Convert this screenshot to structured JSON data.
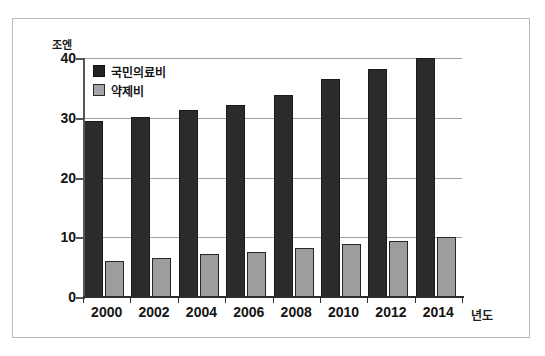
{
  "figure": {
    "unit_label": "조엔",
    "xaxis_title": "년도"
  },
  "legend": {
    "items": [
      {
        "label": "국민의료비",
        "color": "#2b2b2b",
        "swatch": "dark"
      },
      {
        "label": "약제비",
        "color": "#9d9d9d",
        "swatch": "light"
      }
    ]
  },
  "chart_data": {
    "type": "bar",
    "title": "",
    "subtitle": "",
    "xlabel": "년도",
    "ylabel": "조엔",
    "categories": [
      "2000",
      "2002",
      "2004",
      "2006",
      "2008",
      "2010",
      "2012",
      "2014"
    ],
    "series": [
      {
        "name": "국민의료비",
        "color": "#2b2b2b",
        "values": [
          29.5,
          30.1,
          31.3,
          32.1,
          33.8,
          36.5,
          38.2,
          40.0
        ]
      },
      {
        "name": "약제비",
        "color": "#9d9d9d",
        "values": [
          6.0,
          6.5,
          7.2,
          7.6,
          8.2,
          8.8,
          9.4,
          10.0
        ]
      }
    ],
    "yticks": [
      0,
      10,
      20,
      30,
      40
    ],
    "ylim": [
      0,
      40
    ],
    "grid": true,
    "legend_position": "top-left"
  }
}
